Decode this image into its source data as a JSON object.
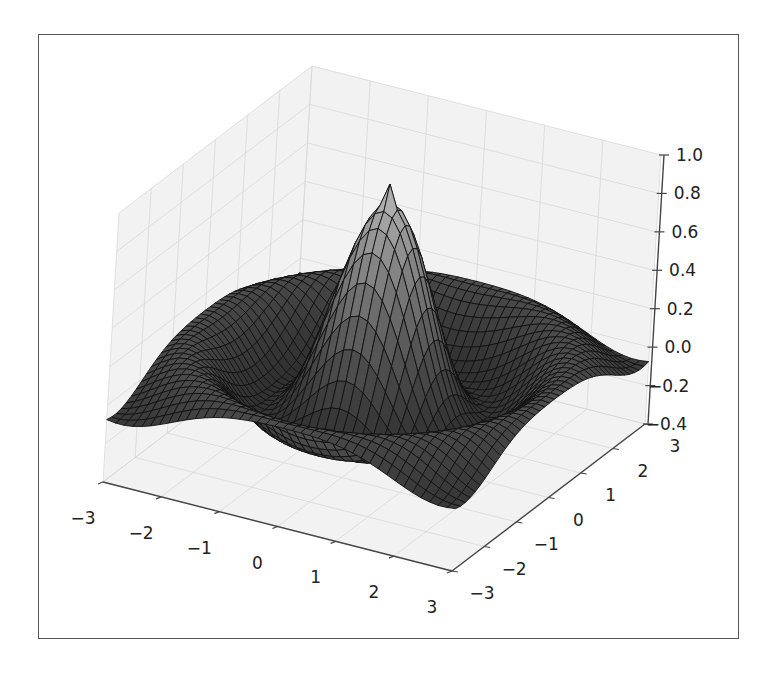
{
  "chart_data": {
    "type": "surface3d",
    "title": "",
    "function": "z = sin(pi*R)/(pi*R), R = sqrt(x^2 + y^2)",
    "xlabel": "",
    "ylabel": "",
    "zlabel": "",
    "x_range": [
      -3,
      3
    ],
    "y_range": [
      -3,
      3
    ],
    "zlim": [
      -0.4,
      1.0
    ],
    "x_ticks": [
      "−3",
      "−2",
      "−1",
      "0",
      "1",
      "2",
      "3"
    ],
    "y_ticks": [
      "−3",
      "−2",
      "−1",
      "0",
      "1",
      "2",
      "3"
    ],
    "z_ticks": [
      "−0.4",
      "−0.2",
      "0.0",
      "0.2",
      "0.4",
      "0.6",
      "0.8",
      "1.0"
    ],
    "x_tick_values": [
      -3,
      -2,
      -1,
      0,
      1,
      2,
      3
    ],
    "y_tick_values": [
      -3,
      -2,
      -1,
      0,
      1,
      2,
      3
    ],
    "z_tick_values": [
      -0.4,
      -0.2,
      0.0,
      0.2,
      0.4,
      0.6,
      0.8,
      1.0
    ],
    "grid_resolution": 40,
    "peak_value": 0.9,
    "grid": true,
    "legend": null,
    "colors": {
      "surface_low": "#2e2e2e",
      "surface_high": "#f4f4f4",
      "edge": "#111111",
      "pane": "#f2f2f2",
      "pane_grid": "#d8d8d8",
      "axis": "#444444"
    }
  }
}
